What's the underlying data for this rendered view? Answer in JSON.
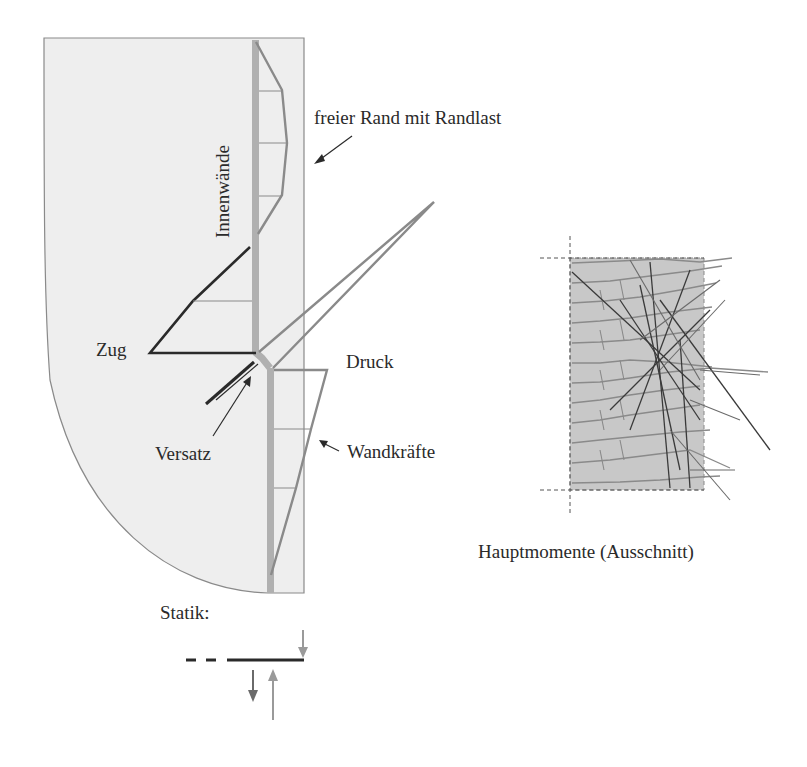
{
  "labels": {
    "innenwaende": "Innenwände",
    "freier_rand": "freier Rand mit Randlast",
    "zug": "Zug",
    "druck": "Druck",
    "versatz": "Versatz",
    "wandkraefte": "Wandkräfte",
    "statik": "Statik:",
    "hauptmomente": "Hauptmomente (Ausschnitt)"
  },
  "colors": {
    "slab_fill": "#eeeeee",
    "slab_outline": "#8a8a8a",
    "wall_band": "#b0b0b0",
    "tension_line": "#2a2a2a",
    "compression_line": "#8a8a8a",
    "moment_fill": "#c8c8c8"
  },
  "panels": {
    "left": "Slab with inner wall, tension/compression force diagrams and wall force distribution",
    "right": "Principal moments detail"
  }
}
